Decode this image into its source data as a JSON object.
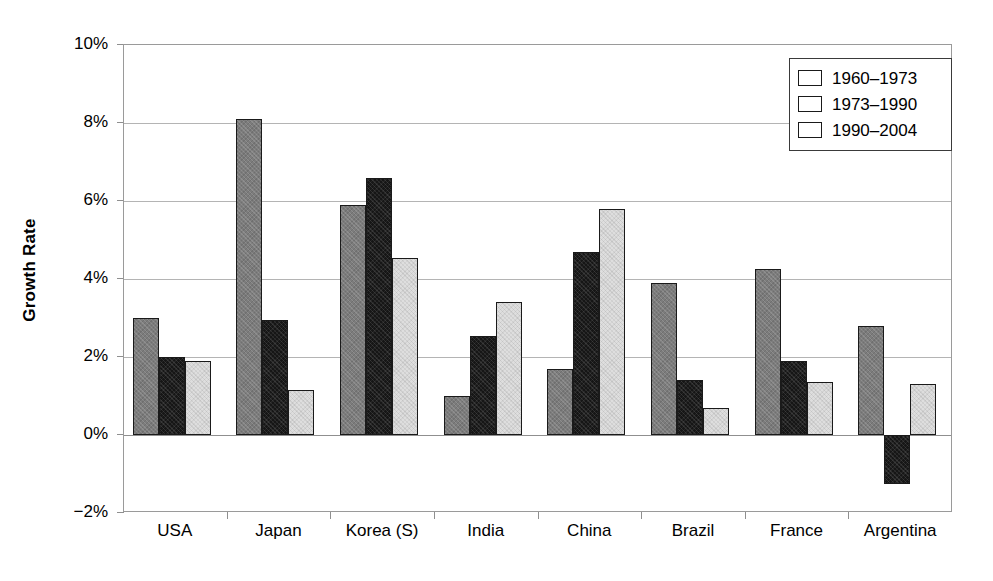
{
  "chart_data": {
    "type": "bar",
    "title": "",
    "xlabel": "",
    "ylabel": "Growth Rate",
    "ylim": [
      -2,
      10
    ],
    "ytick_labels": [
      "10%",
      "8%",
      "6%",
      "4%",
      "2%",
      "0%",
      "-2%"
    ],
    "ytick_values": [
      10,
      8,
      6,
      4,
      2,
      0,
      -2
    ],
    "ytick_suffix": "%",
    "grid": true,
    "grid_axis": "y",
    "legend_position": "top-right",
    "categories": [
      "USA",
      "Japan",
      "Korea (S)",
      "India",
      "China",
      "Brazil",
      "France",
      "Argentina"
    ],
    "series": [
      {
        "name": "1960–1973",
        "color": "#7c7c7c",
        "values": [
          3.0,
          8.1,
          5.9,
          1.0,
          1.7,
          3.9,
          4.25,
          2.8
        ]
      },
      {
        "name": "1973–1990",
        "color": "#161616",
        "values": [
          2.0,
          2.95,
          6.6,
          2.55,
          4.7,
          1.4,
          1.9,
          -1.25
        ]
      },
      {
        "name": "1990–2004",
        "color": "#dedede",
        "values": [
          1.9,
          1.15,
          4.55,
          3.4,
          5.8,
          0.7,
          1.35,
          1.3
        ]
      }
    ]
  },
  "legend": {
    "items": [
      {
        "label": "1960–1973",
        "swatch": "series-1-swatch"
      },
      {
        "label": "1973–1990",
        "swatch": "series-2-swatch"
      },
      {
        "label": "1990–2004",
        "swatch": "series-3-swatch"
      }
    ]
  }
}
